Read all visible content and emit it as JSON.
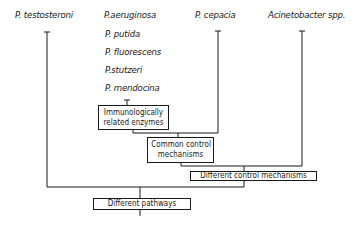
{
  "diagram": {
    "organisms": {
      "col1": "P. testosteroni",
      "col2": [
        "P.aeruginosa",
        "P. putida",
        "P. fluorescens",
        "P.stutzeri",
        "P. mendocina"
      ],
      "col3": "P. cepacia",
      "col4": "Acinetobacter  spp."
    },
    "boxes": {
      "immuno_line1": "Immunologically",
      "immuno_line2": "related  enzymes",
      "common_line1": "Common  control",
      "common_line2": "mechanisms",
      "different_control": "Different  control  mechanisms",
      "different_pathways": "Different  pathways"
    },
    "line_color": "#1a1a1a"
  }
}
